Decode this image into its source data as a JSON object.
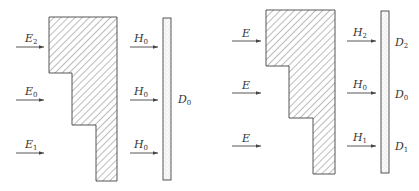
{
  "left_figure": {
    "incident_labels": [
      {
        "base": "E",
        "sub": "2"
      },
      {
        "base": "E",
        "sub": "0"
      },
      {
        "base": "E",
        "sub": "1"
      }
    ],
    "transmitted_labels": [
      {
        "base": "H",
        "sub": "0"
      },
      {
        "base": "H",
        "sub": "0"
      },
      {
        "base": "H",
        "sub": "0"
      }
    ],
    "film_label": {
      "base": "D",
      "sub": "0"
    }
  },
  "right_figure": {
    "incident_labels": [
      {
        "base": "E",
        "sub": ""
      },
      {
        "base": "E",
        "sub": ""
      },
      {
        "base": "E",
        "sub": ""
      }
    ],
    "transmitted_labels": [
      {
        "base": "H",
        "sub": "2"
      },
      {
        "base": "H",
        "sub": "0"
      },
      {
        "base": "H",
        "sub": "1"
      }
    ],
    "film_labels": [
      {
        "base": "D",
        "sub": "2"
      },
      {
        "base": "D",
        "sub": "0"
      },
      {
        "base": "D",
        "sub": "1"
      }
    ]
  },
  "colors": {
    "line": "#444444",
    "hatch": "#555555",
    "text": "#333333"
  }
}
